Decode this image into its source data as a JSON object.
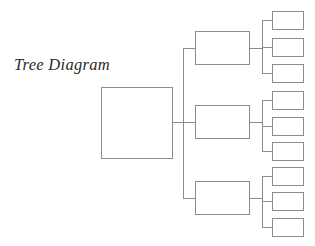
{
  "canvas": {
    "width": 315,
    "height": 246,
    "background": "#ffffff"
  },
  "title": {
    "text": "Tree Diagram",
    "color": "#2b2b2b",
    "x": 14,
    "y": 57
  },
  "style": {
    "node_stroke": "#8c8c8c",
    "node_fill": "#ffffff",
    "connector_stroke": "#8c8c8c",
    "stroke_width": 1
  },
  "nodes": {
    "root": {
      "id": "root",
      "label": "",
      "x": 101,
      "y": 87,
      "w": 71,
      "h": 71
    },
    "branches": [
      {
        "id": "branch-1",
        "label": "",
        "x": 195,
        "y": 31,
        "w": 54,
        "h": 33
      },
      {
        "id": "branch-2",
        "label": "",
        "x": 195,
        "y": 105,
        "w": 54,
        "h": 33
      },
      {
        "id": "branch-3",
        "label": "",
        "x": 195,
        "y": 181,
        "w": 54,
        "h": 33
      }
    ],
    "leaves": [
      {
        "id": "leaf-1-1",
        "label": "",
        "parent": "branch-1",
        "x": 272,
        "y": 11,
        "w": 31,
        "h": 18
      },
      {
        "id": "leaf-1-2",
        "label": "",
        "parent": "branch-1",
        "x": 272,
        "y": 38,
        "w": 31,
        "h": 18
      },
      {
        "id": "leaf-1-3",
        "label": "",
        "parent": "branch-1",
        "x": 272,
        "y": 64,
        "w": 31,
        "h": 18
      },
      {
        "id": "leaf-2-1",
        "label": "",
        "parent": "branch-2",
        "x": 272,
        "y": 91,
        "w": 31,
        "h": 18
      },
      {
        "id": "leaf-2-2",
        "label": "",
        "parent": "branch-2",
        "x": 272,
        "y": 117,
        "w": 31,
        "h": 18
      },
      {
        "id": "leaf-2-3",
        "label": "",
        "parent": "branch-2",
        "x": 272,
        "y": 142,
        "w": 31,
        "h": 18
      },
      {
        "id": "leaf-3-1",
        "label": "",
        "parent": "branch-3",
        "x": 272,
        "y": 167,
        "w": 31,
        "h": 18
      },
      {
        "id": "leaf-3-2",
        "label": "",
        "parent": "branch-3",
        "x": 272,
        "y": 192,
        "w": 31,
        "h": 18
      },
      {
        "id": "leaf-3-3",
        "label": "",
        "parent": "branch-3",
        "x": 272,
        "y": 218,
        "w": 31,
        "h": 18
      }
    ]
  },
  "connectors": {
    "root_stub": {
      "x1": 172,
      "y1": 122,
      "x2": 183,
      "y2": 122
    },
    "trunk": {
      "x1": 183,
      "y1": 48,
      "x2": 183,
      "y2": 198
    },
    "branch_stubs": [
      {
        "x1": 183,
        "y1": 48,
        "x2": 195,
        "y2": 48
      },
      {
        "x1": 183,
        "y1": 122,
        "x2": 195,
        "y2": 122
      },
      {
        "x1": 183,
        "y1": 198,
        "x2": 195,
        "y2": 198
      }
    ],
    "branch_out_stubs": [
      {
        "x1": 249,
        "y1": 48,
        "x2": 262,
        "y2": 48
      },
      {
        "x1": 249,
        "y1": 122,
        "x2": 262,
        "y2": 122
      },
      {
        "x1": 249,
        "y1": 198,
        "x2": 262,
        "y2": 198
      }
    ],
    "leaf_spines": [
      {
        "x1": 262,
        "y1": 20,
        "x2": 262,
        "y2": 73
      },
      {
        "x1": 262,
        "y1": 100,
        "x2": 262,
        "y2": 151
      },
      {
        "x1": 262,
        "y1": 176,
        "x2": 262,
        "y2": 227
      }
    ],
    "leaf_stubs": [
      {
        "x1": 262,
        "y1": 20,
        "x2": 272,
        "y2": 20
      },
      {
        "x1": 262,
        "y1": 47,
        "x2": 272,
        "y2": 47
      },
      {
        "x1": 262,
        "y1": 73,
        "x2": 272,
        "y2": 73
      },
      {
        "x1": 262,
        "y1": 100,
        "x2": 272,
        "y2": 100
      },
      {
        "x1": 262,
        "y1": 126,
        "x2": 272,
        "y2": 126
      },
      {
        "x1": 262,
        "y1": 151,
        "x2": 272,
        "y2": 151
      },
      {
        "x1": 262,
        "y1": 176,
        "x2": 272,
        "y2": 176
      },
      {
        "x1": 262,
        "y1": 201,
        "x2": 272,
        "y2": 201
      },
      {
        "x1": 262,
        "y1": 227,
        "x2": 272,
        "y2": 227
      }
    ]
  }
}
